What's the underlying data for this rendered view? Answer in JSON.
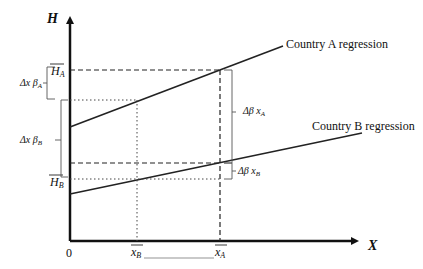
{
  "diagram": {
    "axes": {
      "y_label": "H",
      "x_label": "X",
      "origin_label": "0"
    },
    "lines": [
      {
        "name": "Country A regression",
        "label": "Country A regression"
      },
      {
        "name": "Country B regression",
        "label": "Country B regression"
      }
    ],
    "y_markers": {
      "h_a": "H",
      "h_a_sub": "A",
      "h_b": "H",
      "h_b_sub": "B"
    },
    "x_markers": {
      "x_b": "x",
      "x_b_sub": "B",
      "x_a": "x",
      "x_a_sub": "A"
    },
    "brackets": {
      "dx_beta_a": {
        "pre": "Δx β",
        "sub": "A"
      },
      "dx_beta_b": {
        "pre": "Δx β",
        "sub": "B"
      },
      "dbeta_x_a": {
        "pre": "Δβ x",
        "sub": "A"
      },
      "dbeta_x_b": {
        "pre": "Δβ x",
        "sub": "B"
      }
    },
    "colors": {
      "line": "#222222",
      "axis": "#111111",
      "bracket": "#555555"
    }
  }
}
